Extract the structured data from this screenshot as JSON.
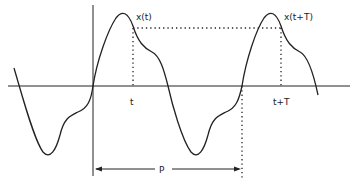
{
  "diagram": {
    "type": "periodic-signal",
    "labels": {
      "x_t": "x(t)",
      "x_t_plus_T": "x(t+T)",
      "t": "t",
      "t_plus_T": "t+T",
      "period": "P"
    },
    "colors": {
      "stroke": "#222222",
      "background": "#ffffff"
    }
  }
}
